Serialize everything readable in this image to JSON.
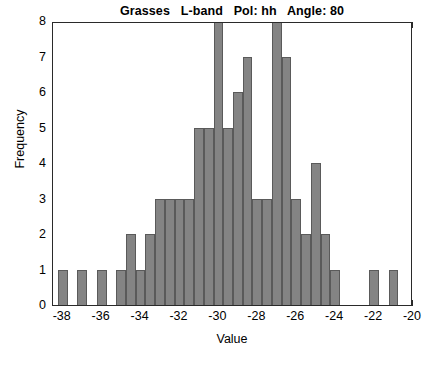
{
  "chart_data": {
    "type": "bar",
    "title": "Grasses   L-band   Pol: hh   Angle: 80",
    "xlabel": "Value",
    "ylabel": "Frequency",
    "xlim": [
      -38.5,
      -20.0
    ],
    "ylim": [
      0,
      8
    ],
    "bin_width": 0.5,
    "grid": false,
    "legend": null,
    "xticks": [
      -38,
      -36,
      -34,
      -32,
      -30,
      -28,
      -26,
      -24,
      -22,
      -20
    ],
    "xtick_labels": [
      "-38",
      "-36",
      "-34",
      "-32",
      "-30",
      "-28",
      "-26",
      "-24",
      "-22",
      "-20"
    ],
    "yticks": [
      0,
      1,
      2,
      3,
      4,
      5,
      6,
      7,
      8
    ],
    "ytick_labels": [
      "0",
      "1",
      "2",
      "3",
      "4",
      "5",
      "6",
      "7",
      "8"
    ],
    "bar_color": "#848484",
    "bar_edge_color": "#5a5a5a",
    "axis_color": "#2a2a2a",
    "bins": [
      {
        "left": -38.25,
        "center": -38.0,
        "value": 1
      },
      {
        "left": -37.25,
        "center": -37.0,
        "value": 1
      },
      {
        "left": -36.25,
        "center": -36.0,
        "value": 1
      },
      {
        "left": -35.25,
        "center": -35.0,
        "value": 1
      },
      {
        "left": -34.75,
        "center": -34.5,
        "value": 2
      },
      {
        "left": -34.25,
        "center": -34.0,
        "value": 1
      },
      {
        "left": -33.75,
        "center": -33.5,
        "value": 2
      },
      {
        "left": -33.25,
        "center": -33.0,
        "value": 3
      },
      {
        "left": -32.75,
        "center": -32.5,
        "value": 3
      },
      {
        "left": -32.25,
        "center": -32.0,
        "value": 3
      },
      {
        "left": -31.75,
        "center": -31.5,
        "value": 3
      },
      {
        "left": -31.25,
        "center": -31.0,
        "value": 5
      },
      {
        "left": -30.75,
        "center": -30.5,
        "value": 5
      },
      {
        "left": -30.25,
        "center": -30.0,
        "value": 8
      },
      {
        "left": -29.75,
        "center": -29.5,
        "value": 5
      },
      {
        "left": -29.25,
        "center": -29.0,
        "value": 6
      },
      {
        "left": -28.75,
        "center": -28.5,
        "value": 7
      },
      {
        "left": -28.25,
        "center": -28.0,
        "value": 3
      },
      {
        "left": -27.75,
        "center": -27.5,
        "value": 3
      },
      {
        "left": -27.25,
        "center": -27.0,
        "value": 8
      },
      {
        "left": -26.75,
        "center": -26.5,
        "value": 7
      },
      {
        "left": -26.25,
        "center": -26.0,
        "value": 3
      },
      {
        "left": -25.75,
        "center": -25.5,
        "value": 2
      },
      {
        "left": -25.25,
        "center": -25.0,
        "value": 4
      },
      {
        "left": -24.75,
        "center": -24.5,
        "value": 2
      },
      {
        "left": -24.25,
        "center": -24.0,
        "value": 1
      },
      {
        "left": -22.25,
        "center": -22.0,
        "value": 1
      },
      {
        "left": -21.25,
        "center": -21.0,
        "value": 1
      }
    ]
  }
}
